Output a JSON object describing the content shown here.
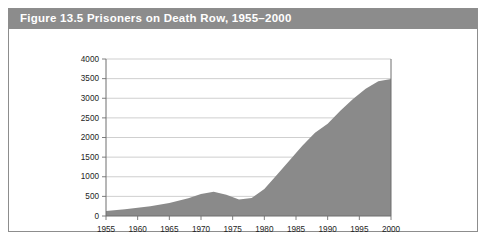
{
  "figure": {
    "label": "Figure 13.5",
    "title": "Figure 13.5  Prisoners on Death Row, 1955–2000",
    "titlebar_color": "#8c8c8c",
    "border_color": "#8d8d8d"
  },
  "chart_data": {
    "type": "area",
    "title": "Prisoners on Death Row, 1955–2000",
    "xlabel": "",
    "ylabel": "",
    "xlim": [
      1955,
      2000
    ],
    "ylim": [
      0,
      4000
    ],
    "grid": true,
    "legend": "none",
    "series_color": "#8a8a8a",
    "ytick_labels": [
      "0",
      "500",
      "1000",
      "1500",
      "2000",
      "2500",
      "3000",
      "3500",
      "4000"
    ],
    "ytick_values": [
      0,
      500,
      1000,
      1500,
      2000,
      2500,
      3000,
      3500,
      4000
    ],
    "xtick_labels": [
      "1955",
      "1960",
      "1965",
      "1970",
      "1975",
      "1980",
      "1985",
      "1990",
      "1995",
      "2000"
    ],
    "xtick_values": [
      1955,
      1960,
      1965,
      1970,
      1975,
      1980,
      1985,
      1990,
      1995,
      2000
    ],
    "x": [
      1955,
      1958,
      1960,
      1962,
      1965,
      1968,
      1970,
      1972,
      1974,
      1976,
      1978,
      1980,
      1982,
      1984,
      1986,
      1988,
      1990,
      1992,
      1994,
      1996,
      1998,
      2000
    ],
    "values": [
      130,
      170,
      210,
      250,
      330,
      450,
      560,
      620,
      540,
      420,
      460,
      690,
      1050,
      1420,
      1790,
      2120,
      2350,
      2680,
      2980,
      3240,
      3430,
      3490
    ],
    "series": [
      {
        "name": "Prisoners on death row",
        "values": [
          130,
          170,
          210,
          250,
          330,
          450,
          560,
          620,
          540,
          420,
          460,
          690,
          1050,
          1420,
          1790,
          2120,
          2350,
          2680,
          2980,
          3240,
          3430,
          3490
        ]
      }
    ]
  }
}
